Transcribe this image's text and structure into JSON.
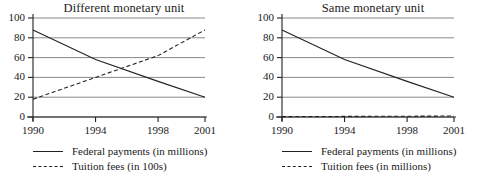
{
  "chart_data": [
    {
      "type": "line",
      "title": "Different monetary unit",
      "xlabel": "",
      "ylabel": "",
      "x": [
        1990,
        1994,
        1998,
        2001
      ],
      "xtick_labels": [
        "1990",
        "1994",
        "1998",
        "2001"
      ],
      "ytick_labels": [
        "0",
        "20",
        "40",
        "60",
        "80",
        "100"
      ],
      "yticks": [
        0,
        20,
        40,
        60,
        80,
        100
      ],
      "ylim": [
        0,
        100
      ],
      "xlim": [
        1990,
        2001
      ],
      "grid": "horizontal",
      "legend_position": "below",
      "series": [
        {
          "name": "Federal payments (in millions)",
          "style": "solid",
          "color": "#222222",
          "values": [
            88,
            58,
            36,
            20
          ]
        },
        {
          "name": "Tuition fees (in 100s)",
          "style": "dashed",
          "color": "#222222",
          "values": [
            18,
            40,
            62,
            88
          ]
        }
      ]
    },
    {
      "type": "line",
      "title": "Same monetary unit",
      "xlabel": "",
      "ylabel": "",
      "x": [
        1990,
        1994,
        1998,
        2001
      ],
      "xtick_labels": [
        "1990",
        "1994",
        "1998",
        "2001"
      ],
      "ytick_labels": [
        "0",
        "20",
        "40",
        "60",
        "80",
        "100"
      ],
      "yticks": [
        0,
        20,
        40,
        60,
        80,
        100
      ],
      "ylim": [
        0,
        100
      ],
      "xlim": [
        1990,
        2001
      ],
      "grid": "horizontal",
      "legend_position": "below",
      "series": [
        {
          "name": "Federal payments (in millions)",
          "style": "solid",
          "color": "#222222",
          "values": [
            88,
            58,
            36,
            20
          ]
        },
        {
          "name": "Tuition fees (in millions)",
          "style": "dashed",
          "color": "#222222",
          "values": [
            0.4,
            0.6,
            0.8,
            1.0
          ]
        }
      ]
    }
  ]
}
